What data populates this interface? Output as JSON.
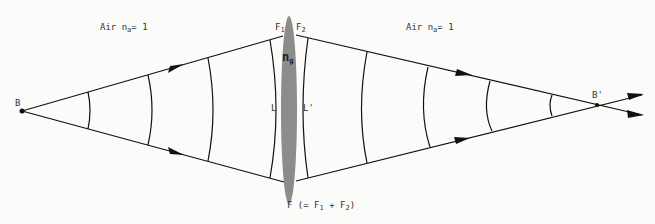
{
  "diagram": {
    "labels": {
      "air_left": {
        "prefix": "Air n",
        "sub": "a",
        "suffix": "= 1"
      },
      "air_right": {
        "prefix": "Air n",
        "sub": "a",
        "suffix": "= 1"
      },
      "source_point": "B",
      "image_point": "B'",
      "lens_index": {
        "base": "n",
        "sub": "g"
      },
      "front_surface": "L",
      "back_surface": "L'",
      "focal_1": {
        "base": "F",
        "sub": "1"
      },
      "focal_2": {
        "base": "F",
        "sub": "2"
      },
      "total_focal": {
        "prefix": "F (=  F",
        "sub1": "1",
        "mid": " + F",
        "sub2": "2",
        "suffix": ")"
      }
    },
    "colors": {
      "line": "#111111",
      "lens_fill": "#8c8c8c",
      "background": "#fbfbf9"
    }
  }
}
